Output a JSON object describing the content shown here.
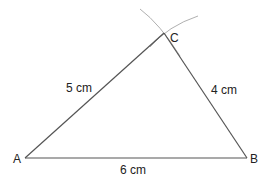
{
  "diagram": {
    "type": "triangle-construction",
    "vertices": [
      {
        "name": "A",
        "label": "A"
      },
      {
        "name": "B",
        "label": "B"
      },
      {
        "name": "C",
        "label": "C"
      }
    ],
    "sides": [
      {
        "between": "A-B",
        "label": "6 cm"
      },
      {
        "between": "A-C",
        "label": "5 cm"
      },
      {
        "between": "B-C",
        "label": "4 cm"
      }
    ],
    "construction_arcs": 2,
    "colors": {
      "line": "#555555",
      "arc": "#aaaaaa",
      "text": "#222222"
    }
  }
}
